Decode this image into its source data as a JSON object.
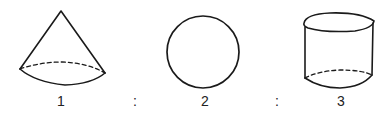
{
  "figure": {
    "shapes": [
      {
        "name": "cone",
        "label": "1"
      },
      {
        "name": "sphere",
        "label": "2"
      },
      {
        "name": "cylinder",
        "label": "3"
      }
    ],
    "separators": [
      ":",
      ":"
    ],
    "stroke_color": "#1a1a1a"
  }
}
